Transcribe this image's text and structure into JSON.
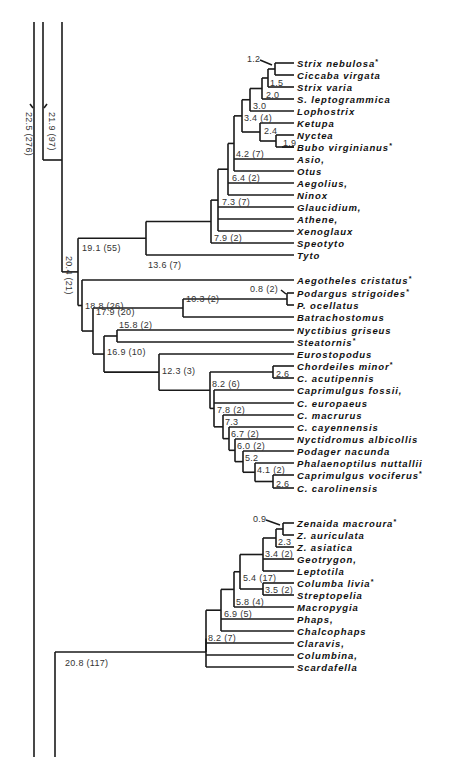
{
  "diagram": {
    "type": "phylogenetic-tree",
    "root_labels": {
      "outer": "22.5 (276)",
      "second": "21.9 (97)",
      "third": "20.4 (21)",
      "doves": "20.8 (117)"
    },
    "taxa": [
      {
        "name": "Strix nebulosa",
        "star": true
      },
      {
        "name": "Ciccaba virgata",
        "star": false
      },
      {
        "name": "Strix varia",
        "star": false
      },
      {
        "name": "S. leptogrammica",
        "star": false
      },
      {
        "name": "Lophostrix",
        "star": false
      },
      {
        "name": "Ketupa",
        "star": false
      },
      {
        "name": "Nyctea",
        "star": false
      },
      {
        "name": "Bubo virginianus",
        "star": true
      },
      {
        "name": "Asio,",
        "star": false
      },
      {
        "name": "Otus",
        "star": false
      },
      {
        "name": "Aegolius,",
        "star": false
      },
      {
        "name": "Ninox",
        "star": false
      },
      {
        "name": "Glaucidium,",
        "star": false
      },
      {
        "name": "Athene,",
        "star": false
      },
      {
        "name": "Xenoglaux",
        "star": false
      },
      {
        "name": "Speotyto",
        "star": false
      },
      {
        "name": "Tyto",
        "star": false
      },
      {
        "name": "Aegotheles cristatus",
        "star": true
      },
      {
        "name": "Podargus strigoides",
        "star": true
      },
      {
        "name": "P. ocellatus",
        "star": false
      },
      {
        "name": "Batrachostomus",
        "star": false
      },
      {
        "name": "Nyctibius griseus",
        "star": false
      },
      {
        "name": "Steatornis",
        "star": true
      },
      {
        "name": "Eurostopodus",
        "star": false
      },
      {
        "name": "Chordeiles minor",
        "star": true
      },
      {
        "name": "C. acutipennis",
        "star": false
      },
      {
        "name": "Caprimulgus fossii,",
        "star": false
      },
      {
        "name": "C. europaeus",
        "star": false
      },
      {
        "name": "C. macrurus",
        "star": false
      },
      {
        "name": "C. cayennensis",
        "star": false
      },
      {
        "name": "Nyctidromus albicollis",
        "star": false
      },
      {
        "name": "Podager nacunda",
        "star": false
      },
      {
        "name": "Phalaenoptilus nuttallii",
        "star": false
      },
      {
        "name": "Caprimulgus vociferus",
        "star": true
      },
      {
        "name": "C. carolinensis",
        "star": false
      },
      {
        "name": "Zenaida macroura",
        "star": true
      },
      {
        "name": "Z. auriculata",
        "star": false
      },
      {
        "name": "Z. asiatica",
        "star": false
      },
      {
        "name": "Geotrygon,",
        "star": false
      },
      {
        "name": "Leptotila",
        "star": false
      },
      {
        "name": "Columba livia",
        "star": true
      },
      {
        "name": "Streptopelia",
        "star": false
      },
      {
        "name": "Macropygia",
        "star": false
      },
      {
        "name": "Phaps,",
        "star": false
      },
      {
        "name": "Chalcophaps",
        "star": false
      },
      {
        "name": "Claravis,",
        "star": false
      },
      {
        "name": "Columbina,",
        "star": false
      },
      {
        "name": "Scardafella",
        "star": false
      }
    ],
    "node_labels": {
      "n1_2": "1.2",
      "n1_5": "1.5",
      "n2_0": "2.0",
      "n3_0": "3.0",
      "n3_4": "3.4 (4)",
      "n2_4": "2.4",
      "n1_9": "1.9",
      "n4_2": "4.2 (7)",
      "n6_4": "6.4 (2)",
      "n7_3": "7.3 (7)",
      "n7_9": "7.9 (2)",
      "n13_6": "13.6 (7)",
      "n19_1": "19.1 (55)",
      "n0_8": "0.8 (2)",
      "n18_8": "18.8 (26)",
      "n10_3": "10.3 (2)",
      "n17_9": "17.9 (20)",
      "n15_8": "15.8 (2)",
      "n16_9": "16.9 (10)",
      "n12_3": "12.3 (3)",
      "n2_6a": "2.6",
      "n8_2": "8.2 (6)",
      "n7_8": "7.8 (2)",
      "n7_3b": "7.3",
      "n6_7": "6.7 (2)",
      "n6_0": "6.0 (2)",
      "n5_2": "5.2",
      "n4_1": "4.1 (2)",
      "n2_6b": "2.6",
      "n0_9": "0.9",
      "n2_3": "2.3",
      "n3_4b": "3.4 (2)",
      "n5_4": "5.4 (17)",
      "n3_5": "3.5 (2)",
      "n5_8": "5.8 (4)",
      "n6_9": "6.9 (5)",
      "n8_2b": "8.2 (7)"
    }
  }
}
